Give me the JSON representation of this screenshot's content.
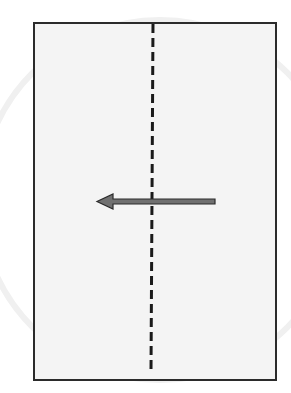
{
  "diagram": {
    "type": "paper-fold-instruction",
    "sheet": {
      "shape": "rectangle",
      "orientation": "portrait",
      "fill": "#f4f4f4",
      "border": "#2b2b2b"
    },
    "fold_line": {
      "style": "dashed",
      "orientation": "vertical",
      "position": "center",
      "color": "#1a1a1a"
    },
    "arrow": {
      "direction": "left",
      "meaning": "fold right half over to the left",
      "color": "#6e6e6e",
      "outline": "#2b2b2b"
    }
  }
}
